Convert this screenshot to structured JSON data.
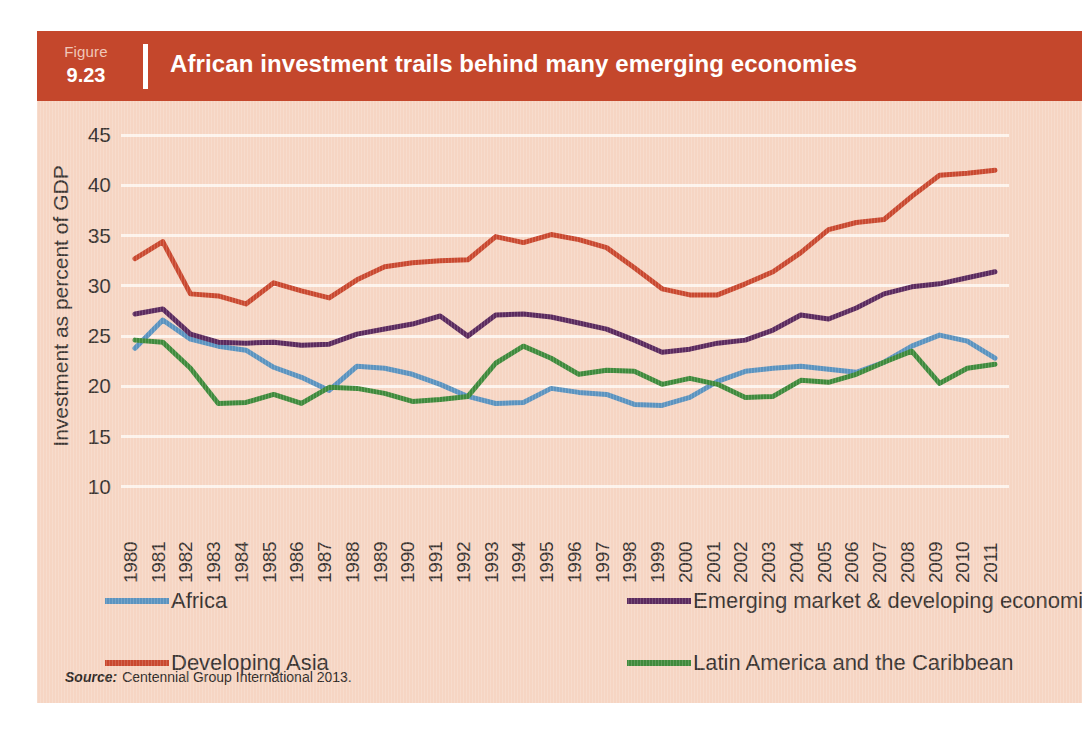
{
  "figure": {
    "figure_word": "Figure",
    "figure_number": "9.23",
    "title": "African investment trails behind many emerging economies",
    "header_color": "#c4472c",
    "panel_color": "#f6d5c3",
    "source_label": "Source:",
    "source_text": "Centennial Group International 2013."
  },
  "chart_data": {
    "type": "line",
    "title": "African investment trails behind many emerging economies",
    "xlabel": "",
    "ylabel": "Investment as percent of GDP",
    "ylim": [
      8,
      46
    ],
    "yticks": [
      45,
      40,
      35,
      30,
      25,
      20,
      15,
      10
    ],
    "grid": true,
    "legend_position": "bottom",
    "x": [
      1980,
      1981,
      1982,
      1983,
      1984,
      1985,
      1986,
      1987,
      1988,
      1989,
      1990,
      1991,
      1992,
      1993,
      1994,
      1995,
      1996,
      1997,
      1998,
      1999,
      2000,
      2001,
      2002,
      2003,
      2004,
      2005,
      2006,
      2007,
      2008,
      2009,
      2010,
      2011
    ],
    "series": [
      {
        "name": "Africa",
        "color": "#5b93bf",
        "values": [
          23.8,
          26.6,
          24.7,
          24.0,
          23.6,
          21.9,
          20.9,
          19.6,
          22.0,
          21.8,
          21.2,
          20.2,
          19.0,
          18.3,
          18.4,
          19.8,
          19.4,
          19.2,
          18.2,
          18.1,
          18.9,
          20.5,
          21.5,
          21.8,
          22.0,
          21.7,
          21.4,
          22.4,
          24.0,
          25.1,
          24.5,
          22.8
        ]
      },
      {
        "name": "Developing Asia",
        "color": "#c9482f",
        "values": [
          32.7,
          34.4,
          29.2,
          29.0,
          28.2,
          30.3,
          29.5,
          28.8,
          30.6,
          31.9,
          32.3,
          32.5,
          32.6,
          34.9,
          34.3,
          35.1,
          34.6,
          33.8,
          31.8,
          29.7,
          29.1,
          29.1,
          30.2,
          31.4,
          33.3,
          35.6,
          36.3,
          36.6,
          38.9,
          41.0,
          41.2,
          41.5
        ]
      },
      {
        "name": "Emerging market & developing economies",
        "color": "#5b2a5e",
        "values": [
          27.2,
          27.7,
          25.2,
          24.4,
          24.3,
          24.4,
          24.1,
          24.2,
          25.2,
          25.7,
          26.2,
          27.0,
          25.0,
          27.1,
          27.2,
          26.9,
          26.3,
          25.7,
          24.6,
          23.4,
          23.7,
          24.3,
          24.6,
          25.6,
          27.1,
          26.7,
          27.8,
          29.2,
          29.9,
          30.2,
          30.8,
          31.4
        ]
      },
      {
        "name": "Latin America and the Caribbean",
        "color": "#3f8a3c",
        "values": [
          24.6,
          24.4,
          21.8,
          18.3,
          18.4,
          19.2,
          18.3,
          19.9,
          19.8,
          19.3,
          18.5,
          18.7,
          19.0,
          22.3,
          24.0,
          22.8,
          21.2,
          21.6,
          21.5,
          20.2,
          20.8,
          20.2,
          18.9,
          19.0,
          20.6,
          20.4,
          21.2,
          22.4,
          23.5,
          20.3,
          21.8,
          22.2
        ]
      }
    ]
  },
  "legend": [
    {
      "label": "Africa",
      "color": "#5b93bf"
    },
    {
      "label": "Developing Asia",
      "color": "#c9482f"
    },
    {
      "label": "Emerging market & developing economies",
      "color": "#5b2a5e"
    },
    {
      "label": "Latin America and the Caribbean",
      "color": "#3f8a3c"
    }
  ]
}
